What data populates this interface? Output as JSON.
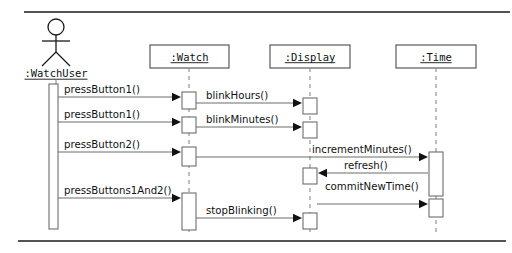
{
  "diagram": {
    "type": "uml-sequence-diagram",
    "title": "",
    "canvas": {
      "width": 512,
      "height": 253,
      "background": "#ffffff"
    },
    "frame": {
      "top_rule_y": 12,
      "bottom_rule_y": 241,
      "stroke_color": "#1a1a1a"
    },
    "colors": {
      "line": "#111111",
      "lifeline": "#8a8a8a",
      "box_stroke": "#4a4a4a",
      "activation_stroke": "#6d6d6d",
      "background": "#ffffff"
    },
    "participants": [
      {
        "id": "watchuser",
        "label": ":WatchUser",
        "kind": "actor",
        "lifeline_x": 56,
        "label_x": 56,
        "label_y": 77,
        "actor": {
          "head_cx": 56,
          "head_cy": 27,
          "head_r": 8,
          "body_top_y": 35,
          "body_bottom_y": 52,
          "arms_y": 41,
          "arm_left_x": 42,
          "arm_right_x": 70,
          "leg_left_x": 42,
          "leg_right_x": 70,
          "leg_bottom_y": 66
        }
      },
      {
        "id": "watch",
        "label": ":Watch",
        "kind": "object",
        "lifeline_x": 189,
        "box": {
          "x": 150,
          "y": 45,
          "width": 79,
          "height": 23
        }
      },
      {
        "id": "display",
        "label": ":Display",
        "kind": "object",
        "lifeline_x": 310,
        "box": {
          "x": 270,
          "y": 45,
          "width": 80,
          "height": 23
        }
      },
      {
        "id": "time",
        "label": ":Time",
        "kind": "object",
        "lifeline_x": 436,
        "box": {
          "x": 396,
          "y": 45,
          "width": 80,
          "height": 23
        }
      }
    ],
    "lifelines": [
      {
        "participant": "watchuser",
        "x": 56,
        "y1": 80,
        "y2": 232
      },
      {
        "participant": "watch",
        "x": 189,
        "y1": 68,
        "y2": 232
      },
      {
        "participant": "display",
        "x": 310,
        "y1": 68,
        "y2": 232
      },
      {
        "participant": "time",
        "x": 436,
        "y1": 68,
        "y2": 232
      }
    ],
    "activations": [
      {
        "participant": "watchuser",
        "x": 49,
        "y": 84,
        "width": 9,
        "height": 145
      },
      {
        "participant": "watch",
        "x": 182,
        "y": 92,
        "width": 14,
        "height": 17
      },
      {
        "participant": "watch",
        "x": 182,
        "y": 117,
        "width": 14,
        "height": 16
      },
      {
        "participant": "watch",
        "x": 182,
        "y": 147,
        "width": 14,
        "height": 19
      },
      {
        "participant": "watch",
        "x": 182,
        "y": 193,
        "width": 14,
        "height": 37
      },
      {
        "participant": "display",
        "x": 303,
        "y": 98,
        "width": 14,
        "height": 16
      },
      {
        "participant": "display",
        "x": 303,
        "y": 122,
        "width": 14,
        "height": 16
      },
      {
        "participant": "display",
        "x": 303,
        "y": 168,
        "width": 14,
        "height": 16
      },
      {
        "participant": "display",
        "x": 303,
        "y": 213,
        "width": 14,
        "height": 16
      },
      {
        "participant": "time",
        "x": 429,
        "y": 152,
        "width": 14,
        "height": 44
      },
      {
        "participant": "time",
        "x": 429,
        "y": 199,
        "width": 14,
        "height": 18
      }
    ],
    "messages": [
      {
        "index": 1,
        "label": "pressButton1()",
        "from": "watchuser",
        "to": "watch",
        "x1": 58,
        "x2": 181,
        "y": 97,
        "label_x": 64,
        "label_y": 93,
        "direction": "right",
        "kind": "call"
      },
      {
        "index": 2,
        "label": "blinkHours()",
        "from": "watch",
        "to": "display",
        "x1": 196,
        "x2": 302,
        "y": 103,
        "label_x": 206,
        "label_y": 99,
        "direction": "right",
        "kind": "call"
      },
      {
        "index": 3,
        "label": "pressButton1()",
        "from": "watchuser",
        "to": "watch",
        "x1": 58,
        "x2": 181,
        "y": 122,
        "label_x": 64,
        "label_y": 118,
        "direction": "right",
        "kind": "call"
      },
      {
        "index": 4,
        "label": "blinkMinutes()",
        "from": "watch",
        "to": "display",
        "x1": 196,
        "x2": 302,
        "y": 127,
        "label_x": 206,
        "label_y": 123,
        "direction": "right",
        "kind": "call"
      },
      {
        "index": 5,
        "label": "pressButton2()",
        "from": "watchuser",
        "to": "watch",
        "x1": 58,
        "x2": 181,
        "y": 152,
        "label_x": 64,
        "label_y": 148,
        "direction": "right",
        "kind": "call"
      },
      {
        "index": 6,
        "label": "incrementMinutes()",
        "from": "watch",
        "to": "time",
        "x1": 196,
        "x2": 428,
        "y": 157,
        "label_x": 312,
        "label_y": 153,
        "direction": "right",
        "kind": "call"
      },
      {
        "index": 7,
        "label": "refresh()",
        "from": "time",
        "to": "display",
        "x1": 428,
        "x2": 318,
        "y": 173,
        "label_x": 344,
        "label_y": 169,
        "direction": "left",
        "kind": "call"
      },
      {
        "index": 8,
        "label": "pressButtons1And2()",
        "from": "watchuser",
        "to": "watch",
        "x1": 58,
        "x2": 181,
        "y": 198,
        "label_x": 64,
        "label_y": 194,
        "direction": "right",
        "kind": "call"
      },
      {
        "index": 9,
        "label": "commitNewTime()",
        "from": "display",
        "to": "time",
        "x1": 317,
        "x2": 428,
        "y": 204,
        "label_x": 325,
        "label_y": 190,
        "direction": "right",
        "kind": "call"
      },
      {
        "index": 10,
        "label": "stopBlinking()",
        "from": "watch",
        "to": "display",
        "x1": 196,
        "x2": 302,
        "y": 218,
        "label_x": 206,
        "label_y": 214,
        "direction": "right",
        "kind": "call"
      }
    ]
  }
}
